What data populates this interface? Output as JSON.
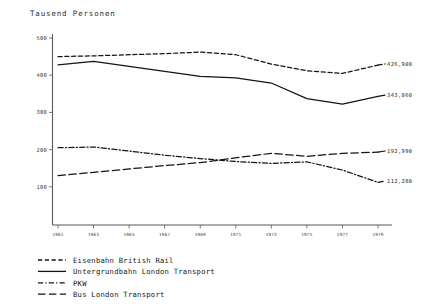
{
  "chart_data": {
    "type": "line",
    "title": "Tausend Personen",
    "xlabel": "",
    "ylabel": "Tausend Personen",
    "ylim": [
      0,
      500
    ],
    "xlim": [
      1961,
      1979
    ],
    "grid": false,
    "legend_position": "bottom-left",
    "x": [
      1961,
      1963,
      1965,
      1967,
      1969,
      1971,
      1973,
      1975,
      1977,
      1979
    ],
    "xtick_labels": [
      "1961",
      "1963",
      "1965",
      "1967",
      "1969",
      "1971",
      "1973",
      "1975",
      "1977",
      "1979"
    ],
    "ytick_labels": [
      "500",
      "400",
      "300",
      "200",
      "100"
    ],
    "ytick_values": [
      500,
      400,
      300,
      200,
      100
    ],
    "series": [
      {
        "name": "Eisenbahn British Rail",
        "style": "dashed",
        "end_label": "426,900",
        "values": [
          450,
          452,
          455,
          458,
          462,
          455,
          430,
          412,
          405,
          427
        ]
      },
      {
        "name": "Untergrundbahn London Transport",
        "style": "solid",
        "end_label": "343,060",
        "values": [
          428,
          437,
          424,
          410,
          397,
          393,
          379,
          337,
          322,
          343
        ]
      },
      {
        "name": "PKW",
        "style": "dash-dot",
        "end_label": "112,280",
        "values": [
          205,
          207,
          196,
          185,
          176,
          168,
          163,
          167,
          145,
          112
        ]
      },
      {
        "name": "Bus London Transport",
        "style": "long-dash",
        "end_label": "192,990",
        "values": [
          130,
          139,
          148,
          157,
          165,
          178,
          190,
          182,
          190,
          193
        ]
      }
    ]
  },
  "legend": {
    "items": [
      {
        "label": "Eisenbahn British Rail",
        "style": "dashed"
      },
      {
        "label": "Untergrundbahn London Transport",
        "style": "solid"
      },
      {
        "label": "PKW",
        "style": "dash-dot"
      },
      {
        "label": "Bus London Transport",
        "style": "long-dash"
      }
    ]
  }
}
